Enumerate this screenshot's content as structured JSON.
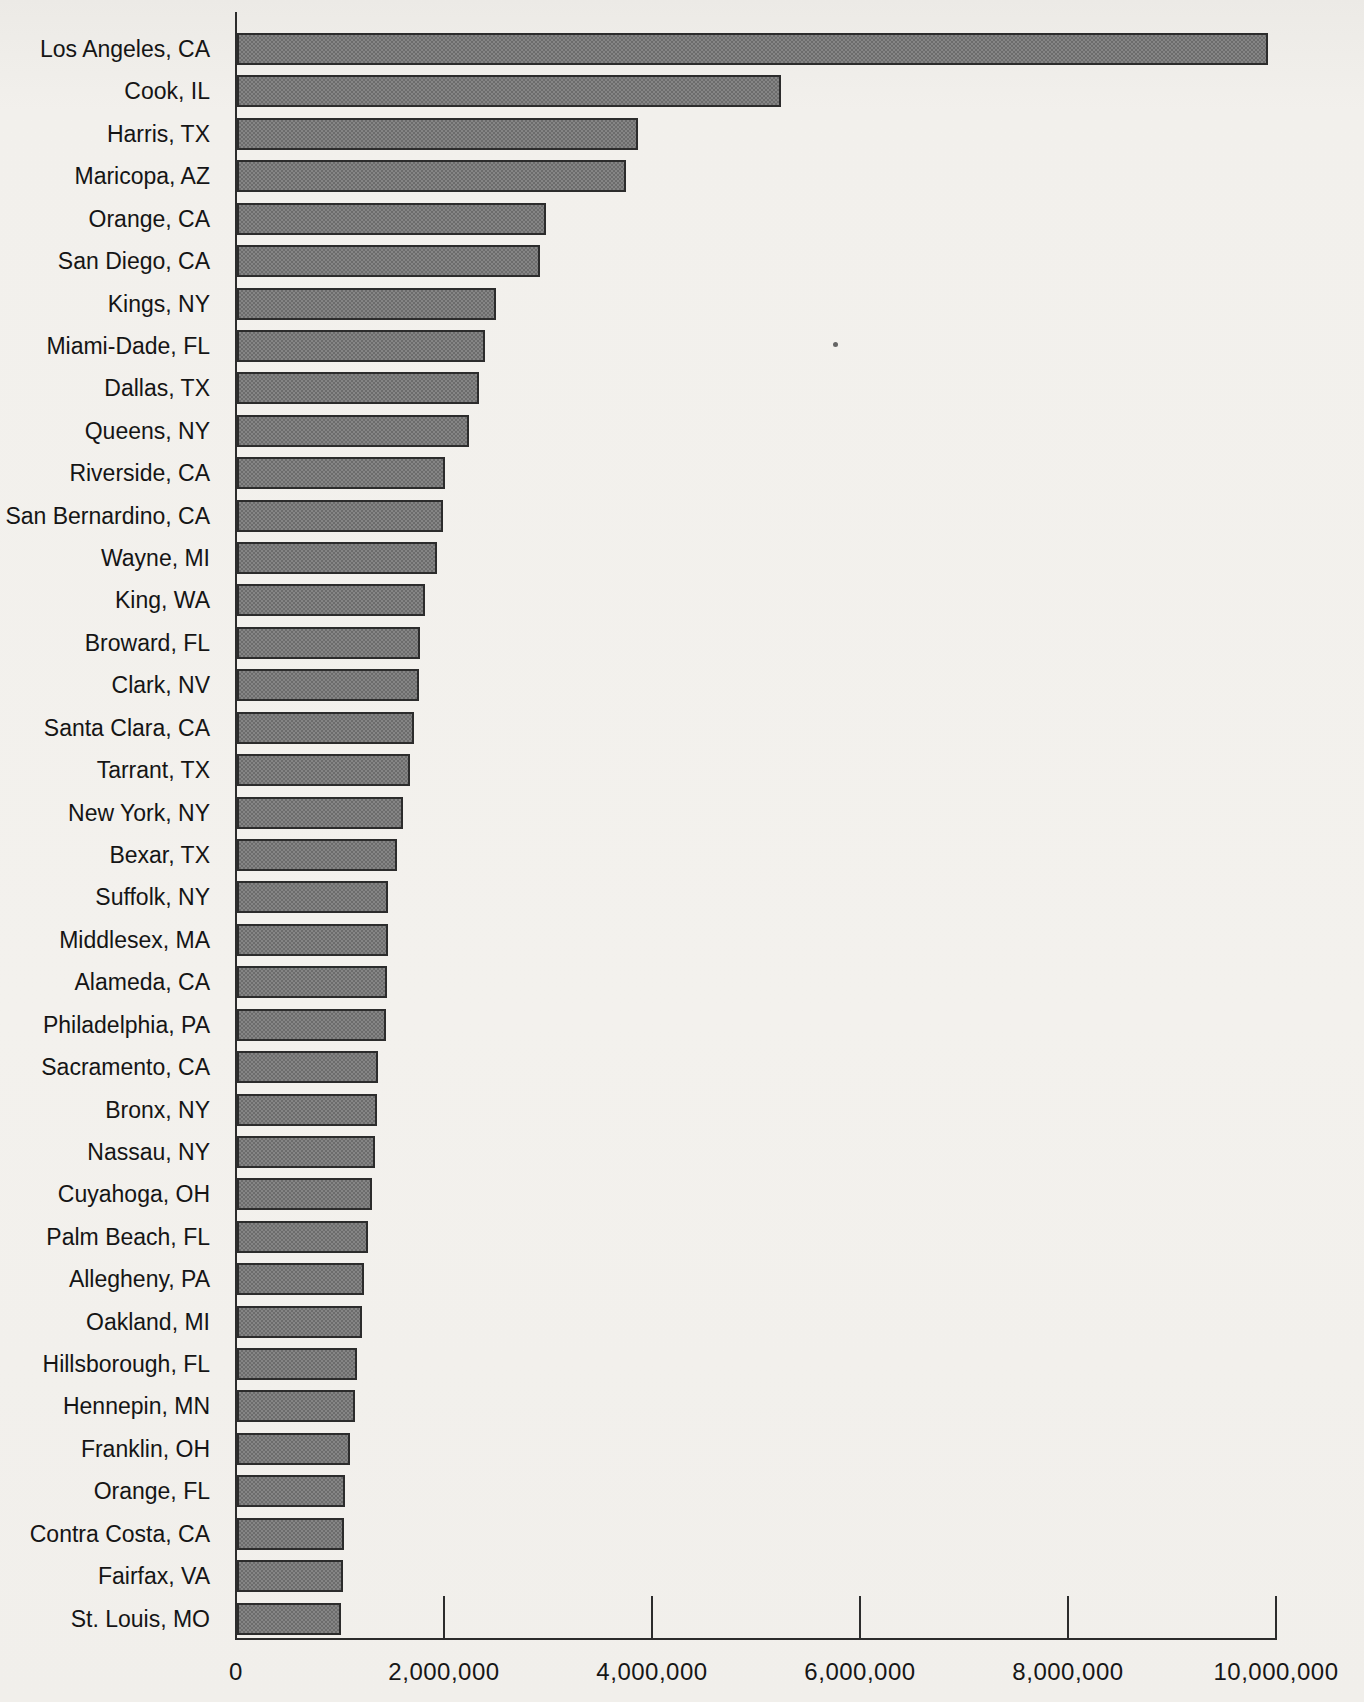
{
  "chart_data": {
    "type": "bar",
    "orientation": "horizontal",
    "title": "",
    "xlabel": "",
    "ylabel": "",
    "grid": false,
    "legend": null,
    "xlim": [
      0,
      10000000
    ],
    "x_ticks": [
      0,
      2000000,
      4000000,
      6000000,
      8000000,
      10000000
    ],
    "x_tick_labels": [
      "0",
      "2,000,000",
      "4,000,000",
      "6,000,000",
      "8,000,000",
      "10,000,000"
    ],
    "categories": [
      "Los Angeles, CA",
      "Cook, IL",
      "Harris, TX",
      "Maricopa, AZ",
      "Orange, CA",
      "San Diego, CA",
      "Kings, NY",
      "Miami-Dade, FL",
      "Dallas, TX",
      "Queens, NY",
      "Riverside, CA",
      "San Bernardino, CA",
      "Wayne, MI",
      "King, WA",
      "Broward, FL",
      "Clark, NV",
      "Santa Clara, CA",
      "Tarrant, TX",
      "New York, NY",
      "Bexar, TX",
      "Suffolk, NY",
      "Middlesex, MA",
      "Alameda, CA",
      "Philadelphia, PA",
      "Sacramento, CA",
      "Bronx, NY",
      "Nassau, NY",
      "Cuyahoga, OH",
      "Palm Beach, FL",
      "Allegheny, PA",
      "Oakland, MI",
      "Hillsborough, FL",
      "Hennepin, MN",
      "Franklin, OH",
      "Orange, FL",
      "Contra Costa, CA",
      "Fairfax, VA",
      "St. Louis, MO"
    ],
    "values": [
      9910000,
      5230000,
      3860000,
      3740000,
      2970000,
      2910000,
      2490000,
      2380000,
      2330000,
      2230000,
      2000000,
      1980000,
      1920000,
      1810000,
      1760000,
      1750000,
      1700000,
      1660000,
      1600000,
      1540000,
      1450000,
      1450000,
      1440000,
      1430000,
      1360000,
      1350000,
      1330000,
      1300000,
      1260000,
      1220000,
      1200000,
      1150000,
      1130000,
      1090000,
      1040000,
      1030000,
      1020000,
      1000000
    ],
    "colors": {
      "bar_fill": "#787878",
      "bar_border": "#2c2c2c",
      "axis": "#2c2c2c",
      "text": "#151515",
      "background": "#f2f0ec"
    }
  }
}
